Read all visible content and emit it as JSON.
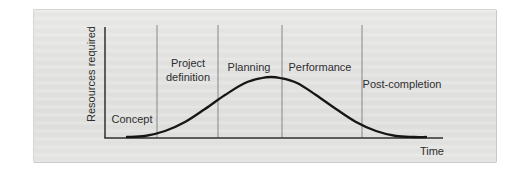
{
  "figure": {
    "kind": "project-life-cycle-resource-curve",
    "panel_background": "#e3e3e2",
    "text_color": "#2e2e2e",
    "axis_color": "#2f2f2f",
    "divider_color": "#7d7d7d",
    "curve_color": "#161616"
  },
  "chart_data": {
    "type": "line",
    "title": "",
    "xlabel": "Time",
    "ylabel": "Resources required",
    "x_ticks": [],
    "y_ticks": [],
    "grid": false,
    "legend": false,
    "phases": [
      "Concept",
      "Project definition",
      "Planning",
      "Performance",
      "Post-completion"
    ],
    "layout_px": {
      "y_axis_x": 105,
      "axis_top_y": 27,
      "baseline_y": 138,
      "axis_right_x": 443,
      "dividers_x": [
        157,
        218,
        282,
        362
      ]
    },
    "curve_points_px": [
      [
        127,
        137
      ],
      [
        145,
        136
      ],
      [
        165,
        131
      ],
      [
        185,
        122
      ],
      [
        205,
        109
      ],
      [
        225,
        95
      ],
      [
        245,
        83
      ],
      [
        262,
        78
      ],
      [
        271,
        77
      ],
      [
        280,
        78
      ],
      [
        297,
        83
      ],
      [
        316,
        95
      ],
      [
        336,
        109
      ],
      [
        356,
        122
      ],
      [
        376,
        131
      ],
      [
        396,
        136
      ],
      [
        414,
        137
      ],
      [
        426,
        137
      ]
    ],
    "values_normalized": {
      "x": [
        0.0,
        0.06,
        0.13,
        0.19,
        0.26,
        0.33,
        0.39,
        0.45,
        0.48,
        0.51,
        0.57,
        0.63,
        0.7,
        0.77,
        0.83,
        0.9,
        0.96,
        1.0
      ],
      "resources": [
        0.0,
        0.02,
        0.1,
        0.25,
        0.47,
        0.7,
        0.9,
        0.98,
        1.0,
        0.98,
        0.9,
        0.7,
        0.47,
        0.25,
        0.1,
        0.02,
        0.0,
        0.0
      ]
    }
  }
}
